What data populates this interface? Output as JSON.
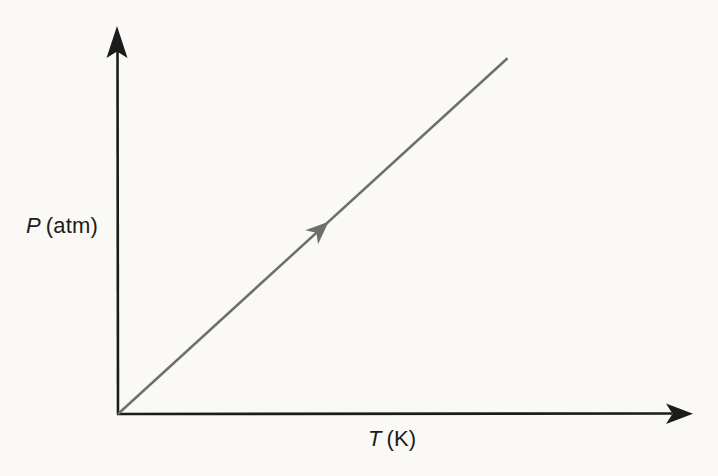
{
  "figure": {
    "y_axis_label": {
      "symbol": "P",
      "unit": "(atm)"
    },
    "x_axis_label": {
      "symbol": "T",
      "unit": "(K)"
    },
    "colors": {
      "background": "#faf9f6",
      "axis": "#1b1b1b",
      "line": "#6e6e6e"
    }
  },
  "chart_data": {
    "type": "line",
    "title": "",
    "xlabel": "T (K)",
    "ylabel": "P (atm)",
    "series": [
      {
        "name": "P vs T",
        "x": [
          0,
          1
        ],
        "y": [
          0,
          1
        ],
        "color": "#6e6e6e",
        "style": "solid",
        "direction_arrow_fraction": 0.535
      }
    ],
    "xlim": [
      0,
      1.43
    ],
    "ylim": [
      0,
      1.04
    ],
    "tick_labels": "none",
    "grid": false,
    "legend": "none",
    "annotations": [
      {
        "type": "direction-arrow",
        "on_series": "P vs T",
        "position_fraction": 0.535,
        "meaning": "path direction: pressure increases with temperature"
      }
    ]
  }
}
